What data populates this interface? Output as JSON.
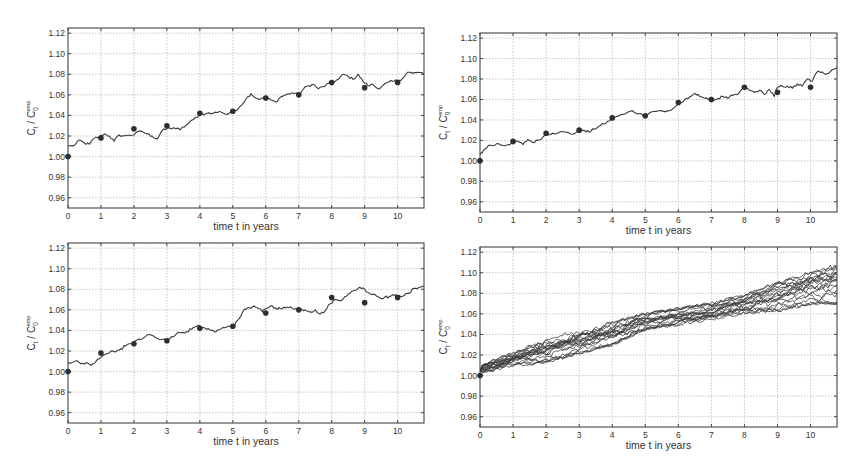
{
  "chart_data": [
    {
      "id": "top-left",
      "type": "line",
      "title": "",
      "xlabel": "time t in years",
      "ylabel": "C_t / C_0^emp",
      "xlim": [
        0,
        10.8
      ],
      "ylim": [
        0.95,
        1.125
      ],
      "xticks": [
        0,
        1,
        2,
        3,
        4,
        5,
        6,
        7,
        8,
        9,
        10
      ],
      "yticks": [
        0.96,
        0.98,
        1.0,
        1.02,
        1.04,
        1.06,
        1.08,
        1.1,
        1.12
      ],
      "ytick_labels": [
        "0.96",
        "0.98",
        "1.00",
        "1.02",
        "1.04",
        "1.06",
        "1.08",
        "1.10",
        "1.12"
      ],
      "grid": true,
      "box": {
        "left": 68,
        "top": 28,
        "right": 424,
        "bottom": 208
      },
      "empirical_points": {
        "t": [
          0,
          1,
          2,
          3,
          4,
          5,
          6,
          7,
          8,
          9,
          10
        ],
        "values": [
          1.0,
          1.018,
          1.027,
          1.03,
          1.042,
          1.044,
          1.057,
          1.06,
          1.072,
          1.067,
          1.072
        ]
      },
      "series": [
        {
          "name": "simulated path",
          "t": [
            0,
            0.2,
            0.35,
            0.5,
            0.65,
            0.8,
            0.95,
            1.1,
            1.25,
            1.4,
            1.55,
            1.7,
            1.85,
            2.0,
            2.2,
            2.4,
            2.55,
            2.7,
            2.85,
            3.0,
            3.2,
            3.4,
            3.6,
            3.8,
            4.0,
            4.2,
            4.4,
            4.6,
            4.8,
            5.0,
            5.2,
            5.4,
            5.55,
            5.7,
            5.85,
            6.0,
            6.15,
            6.3,
            6.45,
            6.6,
            6.8,
            7.0,
            7.15,
            7.3,
            7.45,
            7.6,
            7.75,
            7.9,
            8.05,
            8.2,
            8.35,
            8.5,
            8.65,
            8.8,
            8.95,
            9.1,
            9.25,
            9.4,
            9.55,
            9.7,
            9.85,
            10.0,
            10.15,
            10.3,
            10.45,
            10.6,
            10.8
          ],
          "values": [
            1.01,
            1.011,
            1.016,
            1.013,
            1.012,
            1.018,
            1.019,
            1.022,
            1.02,
            1.015,
            1.021,
            1.02,
            1.021,
            1.021,
            1.025,
            1.022,
            1.02,
            1.017,
            1.025,
            1.027,
            1.028,
            1.026,
            1.031,
            1.036,
            1.041,
            1.042,
            1.042,
            1.044,
            1.041,
            1.043,
            1.048,
            1.056,
            1.061,
            1.057,
            1.056,
            1.057,
            1.055,
            1.053,
            1.058,
            1.06,
            1.062,
            1.06,
            1.066,
            1.069,
            1.07,
            1.066,
            1.068,
            1.071,
            1.073,
            1.075,
            1.08,
            1.078,
            1.075,
            1.08,
            1.073,
            1.069,
            1.07,
            1.066,
            1.069,
            1.072,
            1.073,
            1.074,
            1.076,
            1.082,
            1.081,
            1.082,
            1.08
          ]
        }
      ]
    },
    {
      "id": "top-right",
      "type": "line",
      "title": "",
      "xlabel": "time t in years",
      "ylabel": "C_t / C_0^emp",
      "xlim": [
        0,
        10.8
      ],
      "ylim": [
        0.95,
        1.125
      ],
      "xticks": [
        0,
        1,
        2,
        3,
        4,
        5,
        6,
        7,
        8,
        9,
        10
      ],
      "yticks": [
        0.96,
        0.98,
        1.0,
        1.02,
        1.04,
        1.06,
        1.08,
        1.1,
        1.12
      ],
      "ytick_labels": [
        "0.96",
        "0.98",
        "1.00",
        "1.02",
        "1.04",
        "1.06",
        "1.08",
        "1.10",
        "1.12"
      ],
      "grid": true,
      "box": {
        "left": 480,
        "top": 33,
        "right": 837,
        "bottom": 212
      },
      "empirical_points": {
        "t": [
          0,
          1,
          2,
          3,
          4,
          5,
          6,
          7,
          8,
          9,
          10
        ],
        "values": [
          1.0,
          1.019,
          1.027,
          1.03,
          1.042,
          1.044,
          1.057,
          1.06,
          1.072,
          1.067,
          1.072
        ]
      },
      "series": [
        {
          "name": "simulated path",
          "t": [
            0,
            0.1,
            0.25,
            0.4,
            0.55,
            0.7,
            0.85,
            1.0,
            1.15,
            1.3,
            1.45,
            1.6,
            1.75,
            1.9,
            2.0,
            2.2,
            2.4,
            2.6,
            2.8,
            3.0,
            3.15,
            3.3,
            3.45,
            3.6,
            3.75,
            3.9,
            4.0,
            4.2,
            4.4,
            4.6,
            4.8,
            5.0,
            5.2,
            5.4,
            5.6,
            5.8,
            6.0,
            6.15,
            6.3,
            6.45,
            6.6,
            6.75,
            6.9,
            7.05,
            7.2,
            7.35,
            7.5,
            7.65,
            7.8,
            8.0,
            8.15,
            8.3,
            8.45,
            8.6,
            8.75,
            8.9,
            9.0,
            9.15,
            9.3,
            9.45,
            9.6,
            9.75,
            9.9,
            10.05,
            10.2,
            10.35,
            10.5,
            10.65,
            10.8
          ],
          "values": [
            1.006,
            1.01,
            1.015,
            1.015,
            1.017,
            1.015,
            1.016,
            1.018,
            1.019,
            1.016,
            1.021,
            1.018,
            1.02,
            1.023,
            1.026,
            1.027,
            1.028,
            1.028,
            1.026,
            1.03,
            1.03,
            1.028,
            1.031,
            1.034,
            1.036,
            1.039,
            1.042,
            1.044,
            1.046,
            1.049,
            1.046,
            1.045,
            1.048,
            1.049,
            1.048,
            1.05,
            1.056,
            1.058,
            1.061,
            1.065,
            1.065,
            1.062,
            1.06,
            1.059,
            1.061,
            1.063,
            1.061,
            1.064,
            1.065,
            1.072,
            1.069,
            1.067,
            1.069,
            1.065,
            1.07,
            1.063,
            1.072,
            1.073,
            1.073,
            1.071,
            1.075,
            1.073,
            1.08,
            1.078,
            1.087,
            1.087,
            1.085,
            1.089,
            1.091
          ]
        }
      ]
    },
    {
      "id": "bottom-left",
      "type": "line",
      "title": "",
      "xlabel": "time t in years",
      "ylabel": "C_t / C_0^emp",
      "xlim": [
        0,
        10.8
      ],
      "ylim": [
        0.95,
        1.125
      ],
      "xticks": [
        0,
        1,
        2,
        3,
        4,
        5,
        6,
        7,
        8,
        9,
        10
      ],
      "yticks": [
        0.96,
        0.98,
        1.0,
        1.02,
        1.04,
        1.06,
        1.08,
        1.1,
        1.12
      ],
      "ytick_labels": [
        "0.96",
        "0.98",
        "1.00",
        "1.02",
        "1.04",
        "1.06",
        "1.08",
        "1.10",
        "1.12"
      ],
      "grid": true,
      "box": {
        "left": 68,
        "top": 243,
        "right": 424,
        "bottom": 423
      },
      "empirical_points": {
        "t": [
          0,
          1,
          2,
          3,
          4,
          5,
          6,
          7,
          8,
          9,
          10
        ],
        "values": [
          1.0,
          1.018,
          1.027,
          1.03,
          1.042,
          1.044,
          1.057,
          1.06,
          1.072,
          1.067,
          1.072
        ]
      },
      "series": [
        {
          "name": "simulated path",
          "t": [
            0,
            0.15,
            0.3,
            0.45,
            0.6,
            0.7,
            0.85,
            1.0,
            1.15,
            1.3,
            1.45,
            1.6,
            1.75,
            1.9,
            2.05,
            2.2,
            2.35,
            2.5,
            2.65,
            2.8,
            3.0,
            3.15,
            3.3,
            3.45,
            3.6,
            3.75,
            3.9,
            4.05,
            4.2,
            4.35,
            4.5,
            4.65,
            4.8,
            5.0,
            5.15,
            5.3,
            5.45,
            5.6,
            5.75,
            5.9,
            6.0,
            6.15,
            6.3,
            6.45,
            6.6,
            6.75,
            6.9,
            7.05,
            7.2,
            7.35,
            7.5,
            7.65,
            7.8,
            7.95,
            8.1,
            8.25,
            8.4,
            8.55,
            8.7,
            8.85,
            9.0,
            9.15,
            9.3,
            9.45,
            9.6,
            9.75,
            9.9,
            10.05,
            10.2,
            10.35,
            10.5,
            10.65,
            10.8
          ],
          "values": [
            1.009,
            1.009,
            1.01,
            1.008,
            1.008,
            1.006,
            1.01,
            1.014,
            1.017,
            1.02,
            1.019,
            1.022,
            1.025,
            1.027,
            1.03,
            1.031,
            1.034,
            1.036,
            1.033,
            1.031,
            1.031,
            1.034,
            1.037,
            1.038,
            1.039,
            1.041,
            1.044,
            1.043,
            1.041,
            1.04,
            1.039,
            1.042,
            1.043,
            1.044,
            1.05,
            1.058,
            1.062,
            1.063,
            1.062,
            1.058,
            1.061,
            1.064,
            1.062,
            1.061,
            1.062,
            1.063,
            1.061,
            1.06,
            1.06,
            1.058,
            1.06,
            1.056,
            1.059,
            1.066,
            1.07,
            1.069,
            1.073,
            1.076,
            1.079,
            1.082,
            1.08,
            1.076,
            1.075,
            1.072,
            1.072,
            1.073,
            1.074,
            1.074,
            1.074,
            1.076,
            1.081,
            1.082,
            1.083
          ]
        }
      ]
    },
    {
      "id": "bottom-right",
      "type": "line",
      "title": "",
      "xlabel": "time t in years",
      "ylabel": "C_t / C_0^emp",
      "xlim": [
        0,
        10.8
      ],
      "ylim": [
        0.95,
        1.125
      ],
      "xticks": [
        0,
        1,
        2,
        3,
        4,
        5,
        6,
        7,
        8,
        9,
        10
      ],
      "yticks": [
        0.96,
        0.98,
        1.0,
        1.02,
        1.04,
        1.06,
        1.08,
        1.1,
        1.12
      ],
      "ytick_labels": [
        "0.96",
        "0.98",
        "1.00",
        "1.02",
        "1.04",
        "1.06",
        "1.08",
        "1.10",
        "1.12"
      ],
      "grid": true,
      "box": {
        "left": 480,
        "top": 247,
        "right": 837,
        "bottom": 427
      },
      "empirical_points": {
        "t": [
          0
        ],
        "values": [
          1.0
        ]
      },
      "bundle": {
        "count": 20,
        "start": 1.005,
        "mean_end": 1.088,
        "min_end": 1.07,
        "max_end": 1.11,
        "band_t": [
          0,
          1,
          2,
          3,
          4,
          5,
          6,
          7,
          8,
          9,
          10,
          10.8
        ],
        "band_low": [
          1.002,
          1.01,
          1.013,
          1.022,
          1.03,
          1.045,
          1.05,
          1.055,
          1.06,
          1.062,
          1.07,
          1.07
        ],
        "band_high": [
          1.01,
          1.022,
          1.035,
          1.045,
          1.052,
          1.06,
          1.065,
          1.07,
          1.078,
          1.09,
          1.1,
          1.11
        ]
      },
      "series_note": "multiple (~20) simulated paths rising from ~1.005 at t=0 to ~1.07–1.11 at t=10.8"
    }
  ],
  "labels": {
    "xlabel": "time t in years",
    "ylabel_main": "C",
    "ylabel_sub_t": "t",
    "ylabel_sep": " / C",
    "ylabel_sub_0": "0",
    "ylabel_sup": "emp"
  },
  "colors": {
    "line": "#3a3a3a",
    "dot": "#2e2e2e",
    "grid": "#b9b9b9",
    "axis": "#444444",
    "text": "#333333"
  }
}
